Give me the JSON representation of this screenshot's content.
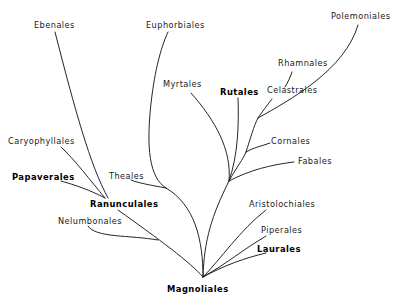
{
  "diagram": {
    "type": "phylogenetic-tree",
    "root": "Magnoliales",
    "labels": [
      {
        "id": "ebenales",
        "text": "Ebenales",
        "x": 34,
        "y": 21,
        "bold": false
      },
      {
        "id": "euphorbiales",
        "text": "Euphorbiales",
        "x": 146,
        "y": 21,
        "bold": false
      },
      {
        "id": "polemoniales",
        "text": "Polemoniales",
        "x": 331,
        "y": 12,
        "bold": false
      },
      {
        "id": "rhamnales",
        "text": "Rhamnales",
        "x": 278,
        "y": 59,
        "bold": false
      },
      {
        "id": "myrtales",
        "text": "Myrtales",
        "x": 163,
        "y": 80,
        "bold": false
      },
      {
        "id": "rutales",
        "text": "Rutales",
        "x": 220,
        "y": 88,
        "bold": true
      },
      {
        "id": "celastrales",
        "text": "Celastrales",
        "x": 267,
        "y": 86,
        "bold": false
      },
      {
        "id": "cornales",
        "text": "Cornales",
        "x": 271,
        "y": 137,
        "bold": false
      },
      {
        "id": "caryophyllales",
        "text": "Caryophyllales",
        "x": 8,
        "y": 137,
        "bold": false
      },
      {
        "id": "fabales",
        "text": "Fabales",
        "x": 298,
        "y": 157,
        "bold": false
      },
      {
        "id": "papaverales",
        "text": "Papaverales",
        "x": 12,
        "y": 173,
        "bold": true
      },
      {
        "id": "theales",
        "text": "Theales",
        "x": 109,
        "y": 172,
        "bold": false
      },
      {
        "id": "ranunculales",
        "text": "Ranunculales",
        "x": 90,
        "y": 200,
        "bold": true
      },
      {
        "id": "aristolochiales",
        "text": "Aristolochiales",
        "x": 249,
        "y": 200,
        "bold": false
      },
      {
        "id": "nelumbonales",
        "text": "Nelumbonales",
        "x": 58,
        "y": 217,
        "bold": false
      },
      {
        "id": "piperales",
        "text": "Piperales",
        "x": 261,
        "y": 226,
        "bold": false
      },
      {
        "id": "laurales",
        "text": "Laurales",
        "x": 257,
        "y": 245,
        "bold": true
      },
      {
        "id": "magnoliales",
        "text": "Magnoliales",
        "x": 167,
        "y": 285,
        "bold": true
      }
    ],
    "edges": [
      {
        "from": "Magnoliales",
        "to": "central-node"
      },
      {
        "from": "central-node",
        "to": "Myrtales"
      },
      {
        "from": "central-node",
        "to": "Rutales"
      },
      {
        "from": "central-node",
        "to": "Fabales"
      },
      {
        "from": "central-node",
        "to": "Cornales"
      },
      {
        "from": "central-node",
        "to": "Celastrales"
      },
      {
        "from": "Celastrales",
        "to": "Rhamnales"
      },
      {
        "from": "central-node",
        "to": "Polemoniales"
      },
      {
        "from": "Magnoliales",
        "to": "theales-node"
      },
      {
        "from": "theales-node",
        "to": "Euphorbiales"
      },
      {
        "from": "theales-node",
        "to": "Theales"
      },
      {
        "from": "Magnoliales",
        "to": "Ranunculales"
      },
      {
        "from": "Ranunculales",
        "to": "Nelumbonales"
      },
      {
        "from": "Ranunculales",
        "to": "Papaverales"
      },
      {
        "from": "Ranunculales",
        "to": "Caryophyllales"
      },
      {
        "from": "Ranunculales",
        "to": "Ebenales"
      },
      {
        "from": "Magnoliales",
        "to": "Aristolochiales"
      },
      {
        "from": "Magnoliales",
        "to": "Piperales"
      },
      {
        "from": "Magnoliales",
        "to": "Laurales"
      }
    ]
  }
}
